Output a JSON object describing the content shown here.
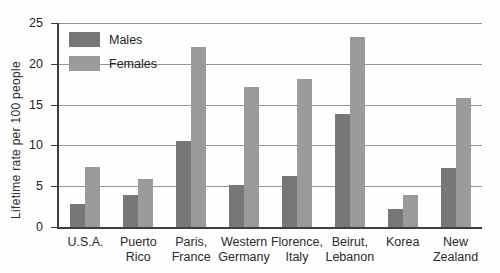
{
  "chart_data": {
    "type": "bar",
    "title": "",
    "xlabel": "",
    "ylabel": "Lifetime rate per 100 people",
    "ylim": [
      0,
      25
    ],
    "yticks": [
      0,
      5,
      10,
      15,
      20,
      25
    ],
    "grid": true,
    "legend_position": "top-left-inside",
    "categories": [
      "U.S.A.",
      "Puerto Rico",
      "Paris, France",
      "Western Germany",
      "Florence, Italy",
      "Beirut, Lebanon",
      "Korea",
      "New Zealand"
    ],
    "category_lines": [
      [
        "U.S.A."
      ],
      [
        "Puerto",
        "Rico"
      ],
      [
        "Paris,",
        "France"
      ],
      [
        "Western",
        "Germany"
      ],
      [
        "Florence,",
        "Italy"
      ],
      [
        "Beirut,",
        "Lebanon"
      ],
      [
        "Korea"
      ],
      [
        "New",
        "Zealand"
      ]
    ],
    "series": [
      {
        "name": "Males",
        "color": "#77777a",
        "values": [
          2.8,
          3.9,
          10.6,
          5.1,
          6.3,
          13.9,
          2.2,
          7.2
        ]
      },
      {
        "name": "Females",
        "color": "#9b9b9d",
        "values": [
          7.4,
          5.9,
          22.0,
          17.1,
          18.1,
          23.3,
          3.9,
          15.8
        ]
      }
    ],
    "axis_color": "#3f3f3f",
    "gridline_color": "#949494",
    "text_color": "#2b2b2b"
  }
}
